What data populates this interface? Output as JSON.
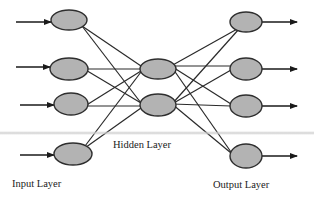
{
  "diagram": {
    "type": "neural-network",
    "colors": {
      "node_fill": "#b3b3b3",
      "node_stroke": "#2e2e2e",
      "edge": "#2a2a2a",
      "background": "#ffffff"
    },
    "layers": {
      "input": {
        "label": "Input Layer",
        "nodes": [
          {
            "id": "i1",
            "cx": 69,
            "cy": 20,
            "rx": 18,
            "ry": 10
          },
          {
            "id": "i2",
            "cx": 69,
            "cy": 69,
            "rx": 19,
            "ry": 11
          },
          {
            "id": "i3",
            "cx": 71,
            "cy": 104,
            "rx": 17,
            "ry": 11
          },
          {
            "id": "i4",
            "cx": 73,
            "cy": 154,
            "rx": 19,
            "ry": 11
          }
        ]
      },
      "hidden": {
        "label": "Hidden Layer",
        "nodes": [
          {
            "id": "h1",
            "cx": 158,
            "cy": 69,
            "rx": 18,
            "ry": 10
          },
          {
            "id": "h2",
            "cx": 158,
            "cy": 105,
            "rx": 18,
            "ry": 11
          }
        ]
      },
      "output": {
        "label": "Output Layer",
        "nodes": [
          {
            "id": "o1",
            "cx": 246,
            "cy": 22,
            "rx": 16,
            "ry": 10
          },
          {
            "id": "o2",
            "cx": 246,
            "cy": 69,
            "rx": 16,
            "ry": 11
          },
          {
            "id": "o3",
            "cx": 246,
            "cy": 106,
            "rx": 16,
            "ry": 11
          },
          {
            "id": "o4",
            "cx": 246,
            "cy": 156,
            "rx": 16,
            "ry": 12
          }
        ]
      }
    },
    "input_arrows": [
      {
        "x1": 16,
        "y1": 22,
        "x2": 51,
        "y2": 22
      },
      {
        "x1": 16,
        "y1": 67,
        "x2": 50,
        "y2": 67
      },
      {
        "x1": 20,
        "y1": 105,
        "x2": 54,
        "y2": 105
      },
      {
        "x1": 20,
        "y1": 155,
        "x2": 54,
        "y2": 155
      }
    ],
    "output_arrows": [
      {
        "x1": 262,
        "y1": 22,
        "x2": 297,
        "y2": 22
      },
      {
        "x1": 262,
        "y1": 69,
        "x2": 297,
        "y2": 69
      },
      {
        "x1": 262,
        "y1": 106,
        "x2": 297,
        "y2": 106
      },
      {
        "x1": 262,
        "y1": 156,
        "x2": 297,
        "y2": 156
      }
    ],
    "edges_input_hidden": [
      {
        "from": "i1",
        "to": "h1",
        "x1": 82,
        "y1": 26,
        "x2": 141,
        "y2": 66
      },
      {
        "from": "i1",
        "to": "h2",
        "x1": 82,
        "y1": 26,
        "x2": 141,
        "y2": 103
      },
      {
        "from": "i2",
        "to": "h1",
        "x1": 84,
        "y1": 69,
        "x2": 141,
        "y2": 69
      },
      {
        "from": "i2",
        "to": "h2",
        "x1": 84,
        "y1": 69,
        "x2": 141,
        "y2": 103
      },
      {
        "from": "i3",
        "to": "h1",
        "x1": 85,
        "y1": 106,
        "x2": 141,
        "y2": 71
      },
      {
        "from": "i3",
        "to": "h2",
        "x1": 85,
        "y1": 106,
        "x2": 141,
        "y2": 106
      },
      {
        "from": "i4",
        "to": "h1",
        "x1": 82,
        "y1": 150,
        "x2": 141,
        "y2": 72
      },
      {
        "from": "i4",
        "to": "h2",
        "x1": 82,
        "y1": 150,
        "x2": 141,
        "y2": 108
      }
    ],
    "edges_hidden_output": [
      {
        "from": "h1",
        "to": "o1",
        "x1": 171,
        "y1": 66,
        "x2": 239,
        "y2": 28
      },
      {
        "from": "h1",
        "to": "o2",
        "x1": 171,
        "y1": 66,
        "x2": 231,
        "y2": 66
      },
      {
        "from": "h1",
        "to": "o3",
        "x1": 171,
        "y1": 66,
        "x2": 231,
        "y2": 104
      },
      {
        "from": "h1",
        "to": "o4",
        "x1": 171,
        "y1": 66,
        "x2": 231,
        "y2": 152
      },
      {
        "from": "h2",
        "to": "o1",
        "x1": 172,
        "y1": 104,
        "x2": 239,
        "y2": 29
      },
      {
        "from": "h2",
        "to": "o2",
        "x1": 172,
        "y1": 104,
        "x2": 231,
        "y2": 70
      },
      {
        "from": "h2",
        "to": "o3",
        "x1": 172,
        "y1": 104,
        "x2": 231,
        "y2": 106
      },
      {
        "from": "h2",
        "to": "o4",
        "x1": 172,
        "y1": 104,
        "x2": 231,
        "y2": 153
      }
    ]
  }
}
